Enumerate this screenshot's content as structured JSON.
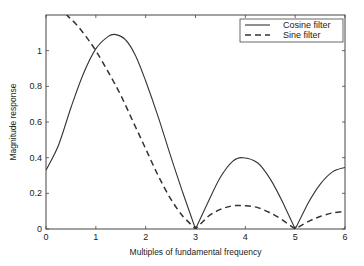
{
  "chart_data": {
    "type": "line",
    "title": "",
    "xlabel": "Multiples of fundamental frequency",
    "ylabel": "Magnitude response",
    "xlim": [
      0,
      6
    ],
    "ylim": [
      0,
      1.2
    ],
    "xticks": [
      0,
      1,
      2,
      3,
      4,
      5,
      6
    ],
    "xtick_labels": [
      "0",
      "1",
      "2",
      "3",
      "4",
      "5",
      "6"
    ],
    "yticks": [
      0,
      0.2,
      0.4,
      0.6,
      0.8,
      1
    ],
    "ytick_labels": [
      "0",
      "0.2",
      "0.4",
      "0.6",
      "0.8",
      "1"
    ],
    "grid": false,
    "legend_position": "upper right",
    "series": [
      {
        "name": "Cosine filter",
        "style": "solid",
        "x": [
          0,
          0.25,
          0.5,
          0.75,
          1.0,
          1.25,
          1.4,
          1.6,
          1.8,
          2.0,
          2.25,
          2.5,
          2.75,
          3.0,
          3.25,
          3.5,
          3.75,
          3.95,
          4.25,
          4.5,
          4.75,
          5.0,
          5.25,
          5.5,
          5.75,
          6.0
        ],
        "y": [
          0.33,
          0.47,
          0.68,
          0.87,
          1.01,
          1.08,
          1.09,
          1.06,
          0.97,
          0.83,
          0.63,
          0.41,
          0.2,
          0.0,
          0.15,
          0.29,
          0.38,
          0.4,
          0.37,
          0.28,
          0.15,
          0.0,
          0.14,
          0.25,
          0.32,
          0.345
        ]
      },
      {
        "name": "Sine filter",
        "style": "dashed",
        "x": [
          0,
          0.25,
          0.42,
          0.6,
          0.8,
          1.0,
          1.25,
          1.5,
          1.75,
          2.0,
          2.25,
          2.5,
          2.75,
          3.0,
          3.25,
          3.5,
          3.75,
          4.0,
          4.25,
          4.5,
          4.75,
          5.0,
          5.25,
          5.5,
          5.75,
          6.0
        ],
        "y": [
          1.33,
          1.27,
          1.2,
          1.15,
          1.08,
          1.0,
          0.88,
          0.75,
          0.6,
          0.45,
          0.3,
          0.17,
          0.07,
          0.0,
          0.07,
          0.11,
          0.13,
          0.13,
          0.12,
          0.09,
          0.05,
          0.0,
          0.04,
          0.07,
          0.09,
          0.1
        ]
      }
    ]
  },
  "legend": {
    "items": [
      {
        "label": "Cosine filter",
        "style": "solid"
      },
      {
        "label": "Sine filter",
        "style": "dashed"
      }
    ]
  },
  "colors": {
    "line": "#333333",
    "axis": "#444444",
    "background": "#ffffff"
  }
}
